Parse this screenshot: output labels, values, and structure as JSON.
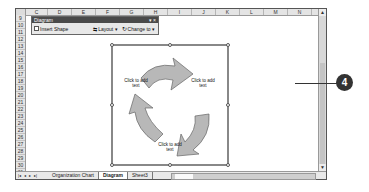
{
  "spreadsheet": {
    "columns": [
      "C",
      "D",
      "E",
      "F",
      "G",
      "H",
      "I",
      "J",
      "K",
      "L",
      "M",
      "N"
    ],
    "rows": [
      "9",
      "10",
      "11",
      "12",
      "13",
      "14",
      "15",
      "16",
      "17",
      "18",
      "19",
      "20",
      "21",
      "22",
      "23",
      "24",
      "25",
      "26",
      "27",
      "28",
      "29",
      "30",
      "31"
    ],
    "sheet_tabs": [
      {
        "label": "Organization Chart",
        "active": false
      },
      {
        "label": "Diagram",
        "active": true
      },
      {
        "label": "Sheet3",
        "active": false
      }
    ],
    "nav_buttons": [
      "|◂",
      "◂",
      "▸",
      "▸|"
    ]
  },
  "diagram_toolbar": {
    "title": "Diagram",
    "controls": "▾ ×",
    "insert_shape_label": "Insert Shape",
    "layout_label": "Layout ▾",
    "change_to_label": "Change to ▾"
  },
  "diagram": {
    "type": "cycle",
    "placeholders": [
      {
        "text": "Click to add text",
        "position": "left"
      },
      {
        "text": "Click to add text",
        "position": "right"
      },
      {
        "text": "Click to add text",
        "position": "bottom"
      }
    ],
    "arrow_color": "#b8b8b8"
  },
  "callout": {
    "number": "4"
  }
}
